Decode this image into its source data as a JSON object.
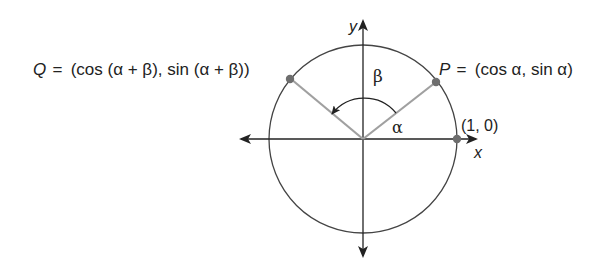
{
  "diagram": {
    "colors": {
      "axis": "#222222",
      "circle": "#444444",
      "radius": "#a0a0a0",
      "point": "#6e6e6e",
      "text": "#222222"
    },
    "axes": {
      "x_label": "x",
      "y_label": "y"
    },
    "points": {
      "P": {
        "name": "P",
        "equals": "=",
        "coords": "(cos α, sin α)"
      },
      "Q": {
        "name": "Q",
        "equals": "=",
        "coords": "(cos (α  + β), sin (α  + β))"
      },
      "unit": {
        "label": "(1, 0)"
      }
    },
    "angles": {
      "alpha": "α",
      "beta": "β"
    }
  }
}
